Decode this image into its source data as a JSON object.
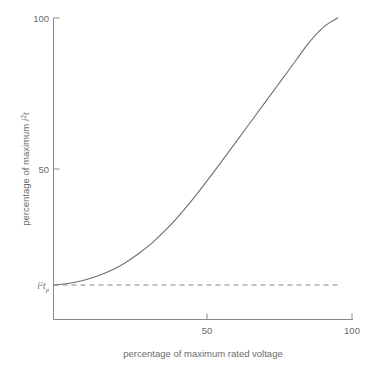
{
  "chart_data": {
    "type": "line",
    "title": "",
    "xlabel": "percentage of maximum rated voltage",
    "ylabel": "percentage of maximum i2t",
    "ylabel_parts": {
      "prefix": "percentage of maximum ",
      "var": "i",
      "exp": "2",
      "suffix": "t"
    },
    "xlim": [
      0,
      105
    ],
    "ylim": [
      0,
      106
    ],
    "grid": false,
    "legend": null,
    "xticks": [
      50,
      100
    ],
    "xtick_labels": [
      "50",
      "100"
    ],
    "yticks": [
      50,
      100
    ],
    "ytick_labels": [
      "50",
      "100"
    ],
    "series": [
      {
        "name": "i2t versus rated voltage",
        "style": "solid",
        "color": "#6e6e79",
        "x": [
          0,
          5,
          10,
          15,
          20,
          25,
          30,
          35,
          40,
          45,
          50,
          55,
          60,
          65,
          70,
          75,
          80,
          85,
          90,
          95,
          100
        ],
        "y": [
          11.6,
          12.1,
          13.0,
          14.4,
          16.3,
          18.8,
          22.0,
          25.8,
          30.3,
          35.5,
          41.2,
          47.3,
          53.6,
          60.0,
          66.4,
          72.8,
          79.2,
          85.6,
          92.0,
          97.0,
          100.0
        ]
      },
      {
        "name": "i2tp threshold",
        "style": "dashed",
        "color": "#8a8a8a",
        "x": [
          0,
          100
        ],
        "y": [
          11.6,
          11.6
        ]
      }
    ],
    "annotations": [
      {
        "name": "threshold-label",
        "text": "i2tp",
        "parts": {
          "var": "i",
          "exp": "2",
          "var2": "t",
          "sub": "p"
        },
        "x": 0,
        "y": 11.6,
        "position": "left-of-axis"
      }
    ]
  }
}
